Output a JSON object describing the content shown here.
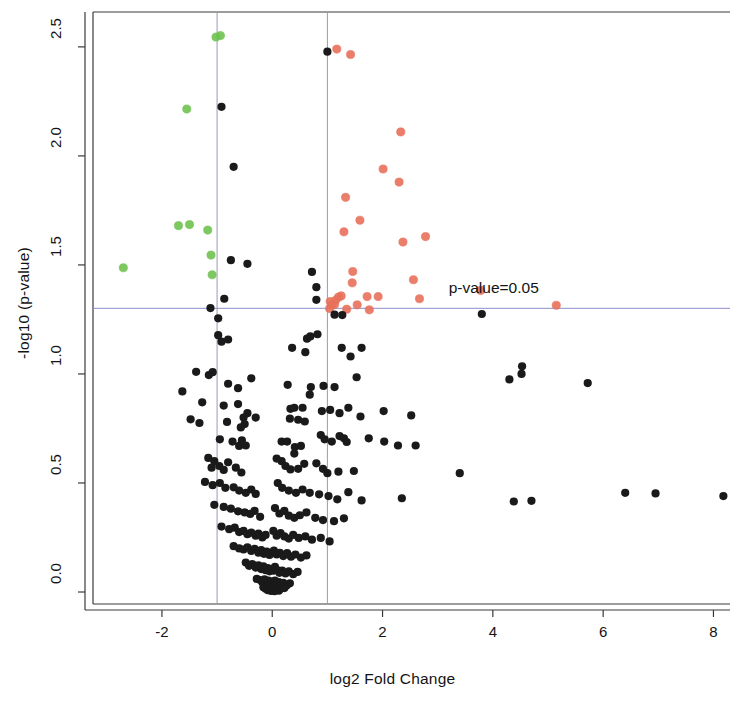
{
  "chart_data": {
    "type": "scatter",
    "title": "",
    "subtitle": "",
    "xlabel": "log2 Fold Change",
    "ylabel": "-log10 (p-value)",
    "xlim": [
      -3.25,
      8.3
    ],
    "ylim": [
      -0.055,
      2.66
    ],
    "xticks": [
      -2,
      0,
      2,
      4,
      6,
      8
    ],
    "xtick_labels": [
      "-2",
      "0",
      "2",
      "4",
      "6",
      "8"
    ],
    "yticks": [
      0.0,
      0.5,
      1.0,
      1.5,
      2.0,
      2.5
    ],
    "ytick_labels": [
      "0.0",
      "0.5",
      "1.0",
      "1.5",
      "2.0",
      "2.5"
    ],
    "grid": false,
    "legend": null,
    "annotations": [
      {
        "text": "p-value=0.05",
        "x": 3.2,
        "y": 1.39,
        "name": "pvalue-threshold-label"
      }
    ],
    "threshold_lines": {
      "horizontal": [
        {
          "y": 1.301,
          "color": "#8f8fd0",
          "label": "p-value=0.05"
        }
      ],
      "vertical": [
        {
          "x": -1,
          "color": "#9a9ab5"
        },
        {
          "x": 1,
          "color": "#9a9ab5"
        }
      ]
    },
    "colors": {
      "not_significant": "#1a1a1a",
      "down_regulated": "#6fc24f",
      "up_regulated": "#e8705a",
      "axis": "#3a3a3a",
      "threshold": "#9a9ab5",
      "background": "#ffffff"
    },
    "point_radius": 4.1,
    "series": [
      {
        "name": "down-regulated",
        "color": "#6fc24f",
        "points": [
          [
            -1.02,
            2.545
          ],
          [
            -0.94,
            2.552
          ],
          [
            -1.55,
            2.215
          ],
          [
            -1.7,
            1.68
          ],
          [
            -1.5,
            1.685
          ],
          [
            -1.17,
            1.66
          ],
          [
            -1.11,
            1.545
          ],
          [
            -1.09,
            1.455
          ],
          [
            -2.7,
            1.487
          ]
        ]
      },
      {
        "name": "up-regulated",
        "color": "#e8705a",
        "points": [
          [
            1.17,
            2.49
          ],
          [
            1.42,
            2.465
          ],
          [
            2.33,
            2.11
          ],
          [
            2.01,
            1.94
          ],
          [
            2.3,
            1.88
          ],
          [
            1.33,
            1.81
          ],
          [
            1.59,
            1.705
          ],
          [
            1.3,
            1.652
          ],
          [
            2.78,
            1.63
          ],
          [
            2.37,
            1.605
          ],
          [
            1.46,
            1.47
          ],
          [
            1.45,
            1.418
          ],
          [
            2.56,
            1.432
          ],
          [
            1.25,
            1.358
          ],
          [
            1.72,
            1.355
          ],
          [
            1.92,
            1.355
          ],
          [
            1.05,
            1.332
          ],
          [
            2.67,
            1.345
          ],
          [
            1.08,
            1.316
          ],
          [
            1.13,
            1.318
          ],
          [
            1.54,
            1.317
          ],
          [
            1.04,
            1.3
          ],
          [
            1.35,
            1.297
          ],
          [
            1.76,
            1.294
          ],
          [
            3.78,
            1.383
          ],
          [
            5.15,
            1.315
          ],
          [
            1.15,
            1.338
          ],
          [
            1.2,
            1.352
          ]
        ]
      },
      {
        "name": "not-significant",
        "color": "#1a1a1a",
        "points": [
          [
            -0.92,
            2.225
          ],
          [
            1.0,
            2.478
          ],
          [
            -0.7,
            1.95
          ],
          [
            -0.75,
            1.522
          ],
          [
            -0.45,
            1.505
          ],
          [
            0.72,
            1.468
          ],
          [
            0.8,
            1.398
          ],
          [
            0.8,
            1.34
          ],
          [
            -0.87,
            1.345
          ],
          [
            -1.12,
            1.302
          ],
          [
            -0.98,
            1.255
          ],
          [
            -0.98,
            1.178
          ],
          [
            -0.92,
            1.148
          ],
          [
            -0.8,
            1.158
          ],
          [
            1.13,
            1.272
          ],
          [
            1.27,
            1.27
          ],
          [
            3.8,
            1.275
          ],
          [
            0.63,
            1.162
          ],
          [
            0.69,
            1.172
          ],
          [
            0.82,
            1.182
          ],
          [
            0.36,
            1.12
          ],
          [
            0.6,
            1.1
          ],
          [
            1.26,
            1.12
          ],
          [
            1.42,
            1.08
          ],
          [
            1.62,
            1.12
          ],
          [
            4.53,
            1.035
          ],
          [
            -1.38,
            1.01
          ],
          [
            -1.15,
            0.995
          ],
          [
            -1.08,
            1.008
          ],
          [
            -1.63,
            0.92
          ],
          [
            -0.8,
            0.955
          ],
          [
            -0.62,
            0.935
          ],
          [
            -0.38,
            0.98
          ],
          [
            0.28,
            0.95
          ],
          [
            0.7,
            0.94
          ],
          [
            0.68,
            0.905
          ],
          [
            0.93,
            0.945
          ],
          [
            1.13,
            0.94
          ],
          [
            1.53,
            0.985
          ],
          [
            4.3,
            0.975
          ],
          [
            4.52,
            1.0
          ],
          [
            5.72,
            0.958
          ],
          [
            -1.27,
            0.87
          ],
          [
            -0.88,
            0.855
          ],
          [
            -0.62,
            0.862
          ],
          [
            -0.45,
            0.82
          ],
          [
            -0.52,
            0.8
          ],
          [
            -0.3,
            0.8
          ],
          [
            -0.82,
            0.78
          ],
          [
            -0.5,
            0.77
          ],
          [
            -0.57,
            0.755
          ],
          [
            0.33,
            0.84
          ],
          [
            0.4,
            0.845
          ],
          [
            0.55,
            0.845
          ],
          [
            0.32,
            0.795
          ],
          [
            0.47,
            0.79
          ],
          [
            0.59,
            0.782
          ],
          [
            0.9,
            0.83
          ],
          [
            1.05,
            0.835
          ],
          [
            1.22,
            0.82
          ],
          [
            1.38,
            0.845
          ],
          [
            1.6,
            0.805
          ],
          [
            2.02,
            0.83
          ],
          [
            2.52,
            0.81
          ],
          [
            -1.48,
            0.792
          ],
          [
            -1.32,
            0.775
          ],
          [
            -0.95,
            0.7
          ],
          [
            -0.72,
            0.69
          ],
          [
            -0.6,
            0.67
          ],
          [
            -0.55,
            0.695
          ],
          [
            -0.48,
            0.672
          ],
          [
            0.17,
            0.69
          ],
          [
            0.27,
            0.69
          ],
          [
            0.41,
            0.665
          ],
          [
            0.52,
            0.67
          ],
          [
            0.4,
            0.635
          ],
          [
            0.88,
            0.72
          ],
          [
            0.95,
            0.7
          ],
          [
            1.08,
            0.69
          ],
          [
            1.22,
            0.715
          ],
          [
            1.3,
            0.705
          ],
          [
            1.35,
            0.688
          ],
          [
            1.75,
            0.705
          ],
          [
            2.03,
            0.69
          ],
          [
            2.28,
            0.672
          ],
          [
            2.6,
            0.672
          ],
          [
            -1.16,
            0.615
          ],
          [
            -1.05,
            0.6
          ],
          [
            -1.1,
            0.57
          ],
          [
            -0.96,
            0.578
          ],
          [
            -0.88,
            0.56
          ],
          [
            -0.8,
            0.595
          ],
          [
            -0.66,
            0.57
          ],
          [
            -0.56,
            0.548
          ],
          [
            0.08,
            0.612
          ],
          [
            0.17,
            0.6
          ],
          [
            0.24,
            0.578
          ],
          [
            0.33,
            0.562
          ],
          [
            0.47,
            0.565
          ],
          [
            0.58,
            0.588
          ],
          [
            0.8,
            0.59
          ],
          [
            0.92,
            0.565
          ],
          [
            1.0,
            0.545
          ],
          [
            1.2,
            0.552
          ],
          [
            1.48,
            0.555
          ],
          [
            3.4,
            0.545
          ],
          [
            -1.22,
            0.505
          ],
          [
            -1.08,
            0.49
          ],
          [
            -0.95,
            0.5
          ],
          [
            -0.85,
            0.478
          ],
          [
            -0.7,
            0.48
          ],
          [
            -0.6,
            0.465
          ],
          [
            -0.48,
            0.455
          ],
          [
            -0.38,
            0.47
          ],
          [
            -0.3,
            0.45
          ],
          [
            0.1,
            0.5
          ],
          [
            0.18,
            0.478
          ],
          [
            0.3,
            0.465
          ],
          [
            0.43,
            0.455
          ],
          [
            0.55,
            0.47
          ],
          [
            0.68,
            0.455
          ],
          [
            0.85,
            0.448
          ],
          [
            1.02,
            0.44
          ],
          [
            1.18,
            0.425
          ],
          [
            1.38,
            0.458
          ],
          [
            1.62,
            0.42
          ],
          [
            2.35,
            0.43
          ],
          [
            4.38,
            0.415
          ],
          [
            4.7,
            0.418
          ],
          [
            6.4,
            0.455
          ],
          [
            6.95,
            0.452
          ],
          [
            8.18,
            0.44
          ],
          [
            -1.05,
            0.4
          ],
          [
            -0.88,
            0.39
          ],
          [
            -0.75,
            0.382
          ],
          [
            -0.62,
            0.37
          ],
          [
            -0.5,
            0.365
          ],
          [
            -0.4,
            0.358
          ],
          [
            -0.32,
            0.372
          ],
          [
            -0.22,
            0.345
          ],
          [
            0.05,
            0.385
          ],
          [
            0.13,
            0.36
          ],
          [
            0.22,
            0.372
          ],
          [
            0.3,
            0.35
          ],
          [
            0.4,
            0.34
          ],
          [
            0.5,
            0.352
          ],
          [
            0.62,
            0.365
          ],
          [
            0.78,
            0.34
          ],
          [
            0.92,
            0.33
          ],
          [
            1.12,
            0.325
          ],
          [
            1.3,
            0.338
          ],
          [
            -0.92,
            0.3
          ],
          [
            -0.78,
            0.288
          ],
          [
            -0.68,
            0.295
          ],
          [
            -0.6,
            0.275
          ],
          [
            -0.52,
            0.28
          ],
          [
            -0.45,
            0.265
          ],
          [
            -0.38,
            0.272
          ],
          [
            -0.3,
            0.258
          ],
          [
            -0.25,
            0.268
          ],
          [
            -0.18,
            0.25
          ],
          [
            -0.12,
            0.262
          ],
          [
            0.02,
            0.28
          ],
          [
            0.08,
            0.258
          ],
          [
            0.15,
            0.27
          ],
          [
            0.22,
            0.255
          ],
          [
            0.3,
            0.245
          ],
          [
            0.38,
            0.262
          ],
          [
            0.48,
            0.248
          ],
          [
            0.6,
            0.255
          ],
          [
            0.72,
            0.24
          ],
          [
            0.88,
            0.248
          ],
          [
            1.04,
            0.232
          ],
          [
            -0.7,
            0.21
          ],
          [
            -0.6,
            0.2
          ],
          [
            -0.52,
            0.195
          ],
          [
            -0.45,
            0.205
          ],
          [
            -0.38,
            0.188
          ],
          [
            -0.32,
            0.198
          ],
          [
            -0.25,
            0.18
          ],
          [
            -0.2,
            0.192
          ],
          [
            -0.15,
            0.175
          ],
          [
            -0.1,
            0.185
          ],
          [
            -0.05,
            0.17
          ],
          [
            0.03,
            0.19
          ],
          [
            0.08,
            0.172
          ],
          [
            0.14,
            0.18
          ],
          [
            0.2,
            0.165
          ],
          [
            0.27,
            0.178
          ],
          [
            0.34,
            0.162
          ],
          [
            0.42,
            0.172
          ],
          [
            0.52,
            0.158
          ],
          [
            0.62,
            0.168
          ],
          [
            -0.48,
            0.135
          ],
          [
            -0.42,
            0.12
          ],
          [
            -0.36,
            0.128
          ],
          [
            -0.3,
            0.112
          ],
          [
            -0.25,
            0.122
          ],
          [
            -0.2,
            0.105
          ],
          [
            -0.16,
            0.118
          ],
          [
            -0.12,
            0.1
          ],
          [
            -0.08,
            0.11
          ],
          [
            -0.05,
            0.095
          ],
          [
            -0.02,
            0.105
          ],
          [
            0.02,
            0.098
          ],
          [
            0.05,
            0.115
          ],
          [
            0.09,
            0.1
          ],
          [
            0.13,
            0.088
          ],
          [
            0.18,
            0.098
          ],
          [
            0.24,
            0.085
          ],
          [
            0.3,
            0.095
          ],
          [
            0.38,
            0.082
          ],
          [
            0.46,
            0.092
          ],
          [
            -0.28,
            0.06
          ],
          [
            -0.22,
            0.055
          ],
          [
            -0.18,
            0.045
          ],
          [
            -0.14,
            0.058
          ],
          [
            -0.1,
            0.04
          ],
          [
            -0.07,
            0.052
          ],
          [
            -0.04,
            0.035
          ],
          [
            -0.01,
            0.048
          ],
          [
            0.02,
            0.038
          ],
          [
            0.05,
            0.052
          ],
          [
            0.08,
            0.035
          ],
          [
            0.12,
            0.045
          ],
          [
            0.16,
            0.03
          ],
          [
            0.2,
            0.042
          ],
          [
            0.26,
            0.03
          ],
          [
            0.32,
            0.04
          ],
          [
            -0.12,
            0.015
          ],
          [
            -0.08,
            0.008
          ],
          [
            -0.05,
            0.018
          ],
          [
            -0.02,
            0.005
          ],
          [
            0.01,
            0.012
          ],
          [
            0.04,
            0.004
          ],
          [
            0.08,
            0.014
          ],
          [
            0.12,
            0.006
          ],
          [
            0.16,
            0.016
          ],
          [
            -0.16,
            0.022
          ],
          [
            0.22,
            0.018
          ]
        ]
      }
    ]
  }
}
